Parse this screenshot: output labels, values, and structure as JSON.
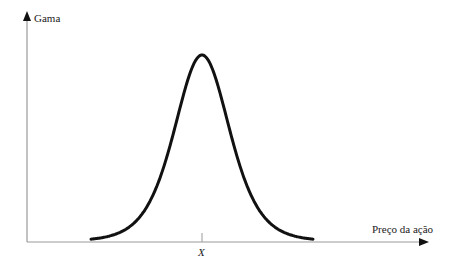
{
  "diagram": {
    "y_axis_label": "Gama",
    "x_axis_label": "Preço da ação",
    "tick_label": "X",
    "colors": {
      "axis": "#9a9a9a",
      "curve": "#111111",
      "text": "#1a1a1a"
    }
  },
  "chart_data": {
    "type": "line",
    "title": "",
    "xlabel": "Preço da ação",
    "ylabel": "Gama",
    "x_ticks": [
      "X"
    ],
    "series": [
      {
        "name": "Gama",
        "x": [
          -111,
          -100,
          -90,
          -80,
          -70,
          -60,
          -50,
          -40,
          -30,
          -20,
          -10,
          0,
          10,
          20,
          30,
          40,
          50,
          60,
          70,
          80,
          90,
          100,
          111
        ],
        "values": [
          0.01,
          0.018,
          0.023,
          0.041,
          0.072,
          0.125,
          0.213,
          0.346,
          0.536,
          0.754,
          0.931,
          1.0,
          0.931,
          0.754,
          0.536,
          0.346,
          0.213,
          0.125,
          0.072,
          0.041,
          0.023,
          0.018,
          0.01
        ]
      }
    ],
    "grid": false,
    "legend": "none"
  }
}
